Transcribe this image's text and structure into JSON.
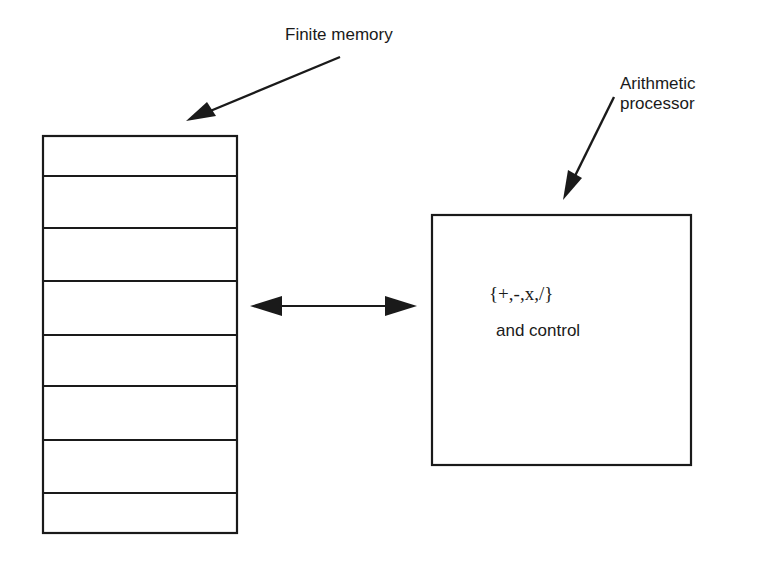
{
  "diagram": {
    "memory": {
      "label": "Finite memory",
      "cells": 8
    },
    "processor": {
      "label_line1": "Arithmetic",
      "label_line2": "processor",
      "operations": "{+,-,x,/}",
      "control": "and control"
    },
    "connector": {
      "type": "bidirectional-arrow",
      "between": [
        "memory",
        "processor"
      ]
    },
    "colors": {
      "stroke": "#1a1a1a",
      "background": "#ffffff"
    }
  }
}
